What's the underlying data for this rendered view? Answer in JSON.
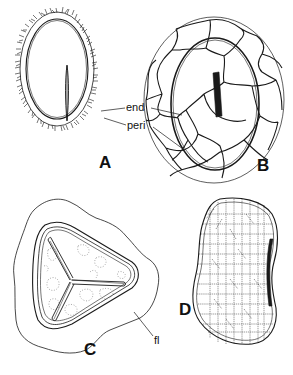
{
  "figure": {
    "panels": [
      {
        "id": "A",
        "label": "A"
      },
      {
        "id": "B",
        "label": "B"
      },
      {
        "id": "C",
        "label": "C"
      },
      {
        "id": "D",
        "label": "D"
      }
    ],
    "annotations": {
      "end": "end",
      "peri": "peri",
      "fl": "fl"
    },
    "colors": {
      "line": "#1a1a1a",
      "dotted": "#8a8a8a",
      "background": "#ffffff"
    }
  }
}
